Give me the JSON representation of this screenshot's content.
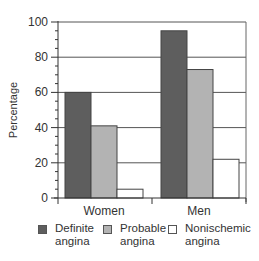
{
  "chart_data": {
    "type": "bar",
    "title": "",
    "xlabel": "",
    "ylabel": "Percentage",
    "ylim": [
      0,
      100
    ],
    "yticks": [
      0,
      20,
      40,
      60,
      80,
      100
    ],
    "grid": true,
    "legend_position": "bottom",
    "categories": [
      "Women",
      "Men"
    ],
    "series": [
      {
        "name": "Definite angina",
        "values": [
          60,
          95
        ],
        "color": "#5e5e5e"
      },
      {
        "name": "Probable angina",
        "values": [
          41,
          73
        ],
        "color": "#b3b3b3"
      },
      {
        "name": "Nonischemic angina",
        "values": [
          5,
          22
        ],
        "color": "#ffffff"
      }
    ]
  },
  "axis": {
    "ylabel": "Percentage",
    "ytick_labels": [
      "0",
      "20",
      "40",
      "60",
      "80",
      "100"
    ],
    "xtick_labels": [
      "Women",
      "Men"
    ]
  },
  "legend": {
    "items": [
      {
        "label": "Definite\nangina",
        "color": "#5e5e5e"
      },
      {
        "label": "Probable\nangina",
        "color": "#b3b3b3"
      },
      {
        "label": "Nonischemic\nangina",
        "color": "#ffffff"
      }
    ]
  }
}
